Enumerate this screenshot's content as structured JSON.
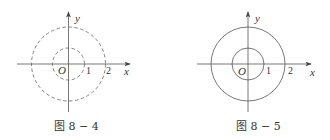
{
  "figures": [
    {
      "id": "fig-8-4",
      "caption": "图 8 − 4",
      "style": "dashed",
      "origin_label": "O",
      "x_label": "x",
      "y_label": "y",
      "ticks": [
        "1",
        "2"
      ],
      "circles": [
        {
          "radius": 1
        },
        {
          "radius": 2
        }
      ]
    },
    {
      "id": "fig-8-5",
      "caption": "图 8 − 5",
      "style": "solid",
      "origin_label": "O",
      "x_label": "x",
      "y_label": "y",
      "ticks": [
        "1",
        "2"
      ],
      "circles": [
        {
          "radius": 1
        },
        {
          "radius": 2
        }
      ]
    }
  ],
  "colors": {
    "line": "#555555",
    "text": "#333333"
  }
}
